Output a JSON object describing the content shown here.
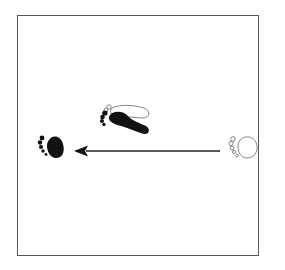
{
  "diagram": {
    "type": "footwork-step-diagram",
    "colors": {
      "frame": "#555555",
      "ink": "#111111",
      "outline": "#777777",
      "background": "#ffffff"
    },
    "elements": [
      {
        "id": "start-foot",
        "kind": "footprint-outline",
        "foot": "ball-of-foot",
        "label": "starting position (outline)"
      },
      {
        "id": "end-foot",
        "kind": "footprint-filled",
        "foot": "ball-of-foot",
        "label": "ending position (filled)"
      },
      {
        "id": "other-foot",
        "kind": "footprint-filled-over-outline",
        "foot": "full-foot",
        "label": "stationary foot"
      },
      {
        "id": "direction-arrow",
        "kind": "arrow",
        "direction": "left"
      }
    ]
  }
}
